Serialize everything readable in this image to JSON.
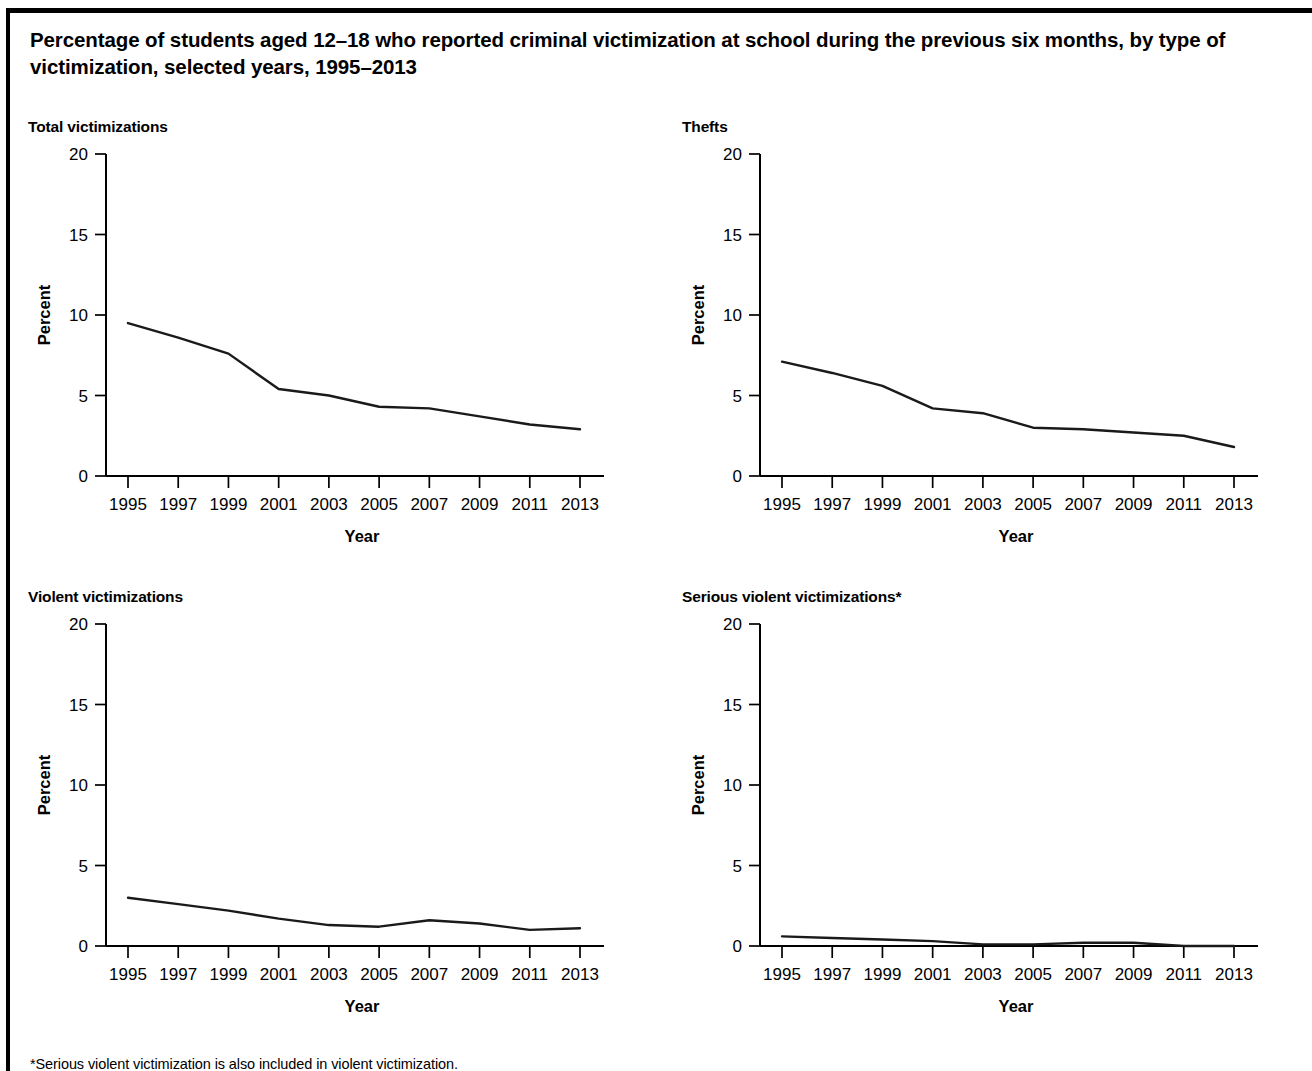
{
  "figure": {
    "title": "Percentage of students aged 12–18 who reported criminal victimization at school during the previous six months, by type of victimization, selected years, 1995–2013",
    "footnote": "*Serious violent victimization is also included in violent victimization."
  },
  "axes": {
    "ylabel": "Percent",
    "xlabel": "Year",
    "ytick_labels": [
      "20",
      "15",
      "10",
      "5",
      "0"
    ],
    "xtick_labels": [
      "1995",
      "1997",
      "1999",
      "2001",
      "2003",
      "2005",
      "2007",
      "2009",
      "2011",
      "2013"
    ],
    "line_color": "#1a1a1a"
  },
  "chart_data": [
    {
      "type": "line",
      "title": "Total victimizations",
      "xlabel": "Year",
      "ylabel": "Percent",
      "x": [
        1995,
        1997,
        1999,
        2001,
        2003,
        2005,
        2007,
        2009,
        2011,
        2013
      ],
      "categories": [
        "1995",
        "1997",
        "1999",
        "2001",
        "2003",
        "2005",
        "2007",
        "2009",
        "2011",
        "2013"
      ],
      "values": [
        9.5,
        8.6,
        7.6,
        5.4,
        5.0,
        4.3,
        4.2,
        3.7,
        3.2,
        2.9
      ],
      "ylim": [
        0,
        20
      ],
      "yticks": [
        0,
        5,
        10,
        15,
        20
      ],
      "grid": false,
      "legend": "none"
    },
    {
      "type": "line",
      "title": "Thefts",
      "xlabel": "Year",
      "ylabel": "Percent",
      "x": [
        1995,
        1997,
        1999,
        2001,
        2003,
        2005,
        2007,
        2009,
        2011,
        2013
      ],
      "categories": [
        "1995",
        "1997",
        "1999",
        "2001",
        "2003",
        "2005",
        "2007",
        "2009",
        "2011",
        "2013"
      ],
      "values": [
        7.1,
        6.4,
        5.6,
        4.2,
        3.9,
        3.0,
        2.9,
        2.7,
        2.5,
        1.8
      ],
      "ylim": [
        0,
        20
      ],
      "yticks": [
        0,
        5,
        10,
        15,
        20
      ],
      "grid": false,
      "legend": "none"
    },
    {
      "type": "line",
      "title": "Violent victimizations",
      "xlabel": "Year",
      "ylabel": "Percent",
      "x": [
        1995,
        1997,
        1999,
        2001,
        2003,
        2005,
        2007,
        2009,
        2011,
        2013
      ],
      "categories": [
        "1995",
        "1997",
        "1999",
        "2001",
        "2003",
        "2005",
        "2007",
        "2009",
        "2011",
        "2013"
      ],
      "values": [
        3.0,
        2.6,
        2.2,
        1.7,
        1.3,
        1.2,
        1.6,
        1.4,
        1.0,
        1.1
      ],
      "ylim": [
        0,
        20
      ],
      "yticks": [
        0,
        5,
        10,
        15,
        20
      ],
      "grid": false,
      "legend": "none"
    },
    {
      "type": "line",
      "title": "Serious violent victimizations*",
      "xlabel": "Year",
      "ylabel": "Percent",
      "x": [
        1995,
        1997,
        1999,
        2001,
        2003,
        2005,
        2007,
        2009,
        2011,
        2013
      ],
      "categories": [
        "1995",
        "1997",
        "1999",
        "2001",
        "2003",
        "2005",
        "2007",
        "2009",
        "2011",
        "2013"
      ],
      "values": [
        0.6,
        0.5,
        0.4,
        0.3,
        0.1,
        0.1,
        0.2,
        0.2,
        0.0,
        0.0
      ],
      "ylim": [
        0,
        20
      ],
      "yticks": [
        0,
        5,
        10,
        15,
        20
      ],
      "grid": false,
      "legend": "none"
    }
  ]
}
